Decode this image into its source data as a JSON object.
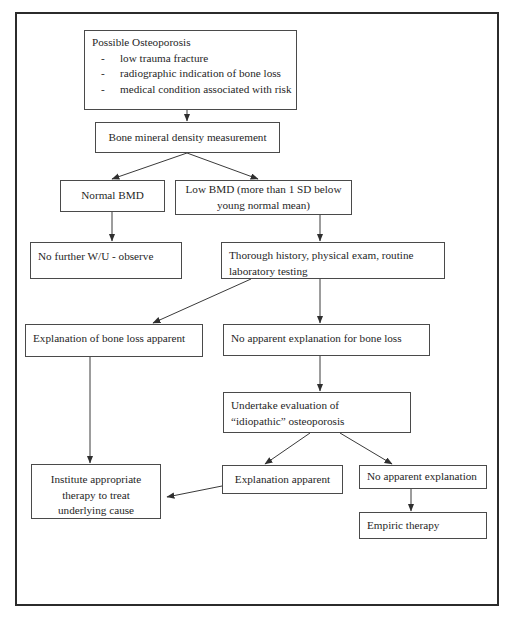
{
  "diagram": {
    "border_color": "#2b2b2b",
    "box_border_color": "#4a4a4a",
    "line_color": "#3a3a3a",
    "background": "#ffffff"
  },
  "nodes": {
    "possible_osteoporosis": {
      "heading": "Possible Osteoporosis",
      "bullets": [
        "low trauma fracture",
        "radiographic indication of bone loss",
        "medical condition associated with risk"
      ]
    },
    "bmd_measurement": {
      "label": "Bone mineral density measurement"
    },
    "normal_bmd": {
      "label": "Normal BMD"
    },
    "low_bmd": {
      "line1": "Low BMD (more than 1 SD below",
      "line2": "young normal mean)"
    },
    "no_further_wu": {
      "label": "No further W/U - observe"
    },
    "thorough_history": {
      "line1": "Thorough history, physical exam, routine",
      "line2": "laboratory testing"
    },
    "explanation_of_bone_loss": {
      "label": "Explanation of bone loss apparent"
    },
    "no_apparent_explanation_bone_loss": {
      "label": "No apparent explanation for bone loss"
    },
    "undertake_evaluation": {
      "line1": "Undertake evaluation of",
      "line2": "“idiopathic” osteoporosis"
    },
    "institute_therapy": {
      "line1": "Institute appropriate",
      "line2": "therapy to treat",
      "line3": "underlying cause"
    },
    "explanation_apparent": {
      "label": "Explanation apparent"
    },
    "no_apparent_explanation": {
      "label": "No apparent explanation"
    },
    "empiric_therapy": {
      "label": "Empiric therapy"
    }
  },
  "caption": {
    "text": ""
  }
}
